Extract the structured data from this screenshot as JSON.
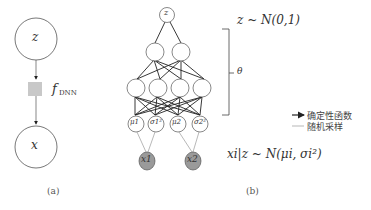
{
  "panel_a": {
    "caption": "(a)",
    "top_node": "z",
    "bottom_node": "x",
    "function_label": "f",
    "function_subscript": "DNN"
  },
  "panel_b": {
    "caption": "(b)",
    "latent_node": "z",
    "prior": "z ~ N(0,1)",
    "params_label": "θ",
    "output_param_nodes": [
      "μ1",
      "σ1²",
      "μ2",
      "σ2²"
    ],
    "observed_nodes": [
      "x1",
      "x2"
    ],
    "likelihood": "xi|z ~ N(μi, σi²)",
    "hidden_layers": [
      2,
      4
    ],
    "legend": [
      {
        "style": "solid-arrow",
        "label": "确定性函数"
      },
      {
        "style": "thin-line",
        "label": "随机采样"
      }
    ]
  },
  "colors": {
    "stroke": "#333333",
    "observed_fill": "#9a9a9a",
    "dnn_box_fill": "#c8c8c8",
    "sample_line": "#888888"
  }
}
